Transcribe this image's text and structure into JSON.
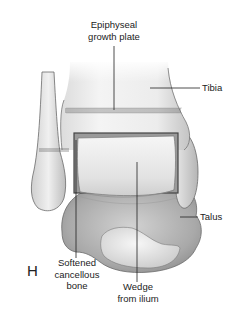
{
  "figure": {
    "panel_letter": "H",
    "labels": {
      "growth_plate_line1": "Epiphyseal",
      "growth_plate_line2": "growth plate",
      "tibia": "Tibia",
      "talus": "Talus",
      "cancellous_line1": "Softened",
      "cancellous_line2": "cancellous",
      "cancellous_line3": "bone",
      "wedge_line1": "Wedge",
      "wedge_line2": "from ilium"
    },
    "colors": {
      "background": "#ffffff",
      "bone_light": "#f2f2f2",
      "bone_mid": "#d6d6d6",
      "bone_dark": "#8f8f8f",
      "outline": "#6b6b6b",
      "leader": "#222222"
    }
  }
}
